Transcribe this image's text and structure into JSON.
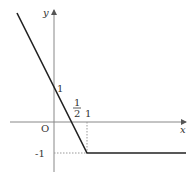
{
  "figure": {
    "axes": {
      "x_label": "x",
      "y_label": "y",
      "origin_label": "O"
    },
    "tick_labels": {
      "y_one": "1",
      "y_neg_one": "-1",
      "x_half_num": "1",
      "x_half_den": "2",
      "x_one": "1"
    },
    "colors": {
      "curve": "#222222",
      "axis": "#888888",
      "dashed": "#999999"
    },
    "function": {
      "pieces": [
        {
          "domain": "x < 1",
          "formula": "y = -2x + 1"
        },
        {
          "domain": "x >= 1",
          "formula": "y = -1"
        }
      ],
      "key_points": [
        {
          "x": 0,
          "y": 1,
          "label": "y-intercept"
        },
        {
          "x": 0.5,
          "y": 0,
          "label": "x-intercept"
        },
        {
          "x": 1,
          "y": -1,
          "label": "corner"
        }
      ]
    }
  }
}
